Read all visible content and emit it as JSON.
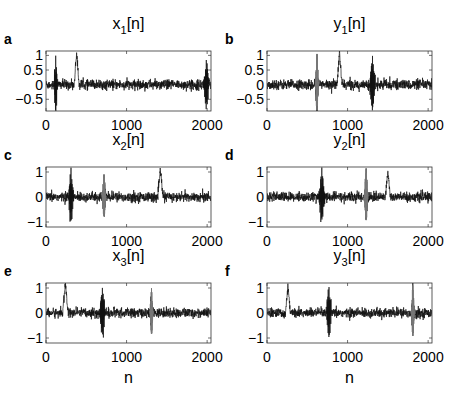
{
  "figure": {
    "width": 460,
    "height": 398,
    "trace_color": "#111111",
    "gray_trace_color": "#777777",
    "axes_color": "#333333"
  },
  "chart_data": [
    {
      "type": "line",
      "panel": "a",
      "title": "x1[n]",
      "title_base": "x",
      "title_sub": "1",
      "title_suffix": "[n]",
      "xlabel": "",
      "ylabel": "",
      "xlim": [
        0,
        2048
      ],
      "ylim": [
        -0.9,
        1.15
      ],
      "xticks": [
        0,
        1000,
        2000
      ],
      "xtick_labels": [
        "0",
        "1000",
        "2000"
      ],
      "yticks": [
        -0.5,
        0,
        0.5,
        1
      ],
      "ytick_labels": [
        "−0.5",
        "0",
        "0.5",
        "1"
      ],
      "grid": false,
      "noise_amplitude": 0.15,
      "events": [
        {
          "kind": "burst",
          "n": 120,
          "width": 30,
          "amplitude": 1.0,
          "gray": false
        },
        {
          "kind": "bump",
          "n": 380,
          "width": 30,
          "amplitude": 1.1,
          "gray": false
        },
        {
          "kind": "burst",
          "n": 1990,
          "width": 40,
          "amplitude": 0.9,
          "gray": false
        }
      ]
    },
    {
      "type": "line",
      "panel": "b",
      "title": "y1[n]",
      "title_base": "y",
      "title_sub": "1",
      "title_suffix": "[n]",
      "xlabel": "",
      "ylabel": "",
      "xlim": [
        0,
        2048
      ],
      "ylim": [
        -0.9,
        1.15
      ],
      "xticks": [
        0,
        1000,
        2000
      ],
      "xtick_labels": [
        "0",
        "1000",
        "2000"
      ],
      "yticks": [
        -0.5,
        0,
        0.5,
        1
      ],
      "ytick_labels": [
        "−0.5",
        "0",
        "0.5",
        "1"
      ],
      "grid": false,
      "noise_amplitude": 0.15,
      "events": [
        {
          "kind": "burst",
          "n": 620,
          "width": 22,
          "amplitude": 1.05,
          "gray": true
        },
        {
          "kind": "bump",
          "n": 900,
          "width": 32,
          "amplitude": 1.05,
          "gray": false
        },
        {
          "kind": "burst",
          "n": 1310,
          "width": 45,
          "amplitude": 0.9,
          "gray": false
        }
      ]
    },
    {
      "type": "line",
      "panel": "c",
      "title": "x2[n]",
      "title_base": "x",
      "title_sub": "2",
      "title_suffix": "[n]",
      "xlabel": "",
      "ylabel": "",
      "xlim": [
        0,
        2048
      ],
      "ylim": [
        -1.2,
        1.2
      ],
      "xticks": [
        0,
        1000,
        2000
      ],
      "xtick_labels": [
        "0",
        "1000",
        "2000"
      ],
      "yticks": [
        -1,
        0,
        1
      ],
      "ytick_labels": [
        "−1",
        "0",
        "1"
      ],
      "grid": false,
      "noise_amplitude": 0.17,
      "events": [
        {
          "kind": "burst",
          "n": 310,
          "width": 40,
          "amplitude": 1.1,
          "gray": false
        },
        {
          "kind": "burst",
          "n": 720,
          "width": 25,
          "amplitude": 0.9,
          "gray": true
        },
        {
          "kind": "bump",
          "n": 1420,
          "width": 32,
          "amplitude": 1.1,
          "gray": false
        }
      ]
    },
    {
      "type": "line",
      "panel": "d",
      "title": "y2[n]",
      "title_base": "y",
      "title_sub": "2",
      "title_suffix": "[n]",
      "xlabel": "",
      "ylabel": "",
      "xlim": [
        0,
        2048
      ],
      "ylim": [
        -1.2,
        1.2
      ],
      "xticks": [
        0,
        1000,
        2000
      ],
      "xtick_labels": [
        "0",
        "1000",
        "2000"
      ],
      "yticks": [
        -1,
        0,
        1
      ],
      "ytick_labels": [
        "−1",
        "0",
        "1"
      ],
      "grid": false,
      "noise_amplitude": 0.17,
      "events": [
        {
          "kind": "burst",
          "n": 680,
          "width": 45,
          "amplitude": 1.1,
          "gray": false
        },
        {
          "kind": "burst",
          "n": 1230,
          "width": 25,
          "amplitude": 1.1,
          "gray": true
        },
        {
          "kind": "bump",
          "n": 1500,
          "width": 32,
          "amplitude": 1.0,
          "gray": false
        }
      ]
    },
    {
      "type": "line",
      "panel": "e",
      "title": "x3[n]",
      "title_base": "x",
      "title_sub": "3",
      "title_suffix": "[n]",
      "xlabel": "n",
      "ylabel": "",
      "xlim": [
        0,
        2048
      ],
      "ylim": [
        -1.2,
        1.2
      ],
      "xticks": [
        0,
        1000,
        2000
      ],
      "xtick_labels": [
        "0",
        "1000",
        "2000"
      ],
      "yticks": [
        -1,
        0,
        1
      ],
      "ytick_labels": [
        "−1",
        "0",
        "1"
      ],
      "grid": false,
      "noise_amplitude": 0.17,
      "events": [
        {
          "kind": "bump",
          "n": 240,
          "width": 34,
          "amplitude": 1.2,
          "gray": false
        },
        {
          "kind": "burst",
          "n": 700,
          "width": 45,
          "amplitude": 1.05,
          "gray": false
        },
        {
          "kind": "burst",
          "n": 1310,
          "width": 22,
          "amplitude": 1.0,
          "gray": true
        }
      ]
    },
    {
      "type": "line",
      "panel": "f",
      "title": "y3[n]",
      "title_base": "y",
      "title_sub": "3",
      "title_suffix": "[n]",
      "xlabel": "n",
      "ylabel": "",
      "xlim": [
        0,
        2048
      ],
      "ylim": [
        -1.2,
        1.2
      ],
      "xticks": [
        0,
        1000,
        2000
      ],
      "xtick_labels": [
        "0",
        "1000",
        "2000"
      ],
      "yticks": [
        -1,
        0,
        1
      ],
      "ytick_labels": [
        "−1",
        "0",
        "1"
      ],
      "grid": false,
      "noise_amplitude": 0.17,
      "events": [
        {
          "kind": "bump",
          "n": 260,
          "width": 34,
          "amplitude": 1.05,
          "gray": false
        },
        {
          "kind": "burst",
          "n": 770,
          "width": 45,
          "amplitude": 1.05,
          "gray": false
        },
        {
          "kind": "burst",
          "n": 1810,
          "width": 22,
          "amplitude": 1.1,
          "gray": true
        }
      ]
    }
  ],
  "layout": {
    "axes": [
      {
        "left": 46,
        "top": 51,
        "width": 165,
        "height": 60
      },
      {
        "left": 267,
        "top": 51,
        "width": 165,
        "height": 60
      },
      {
        "left": 46,
        "top": 167,
        "width": 165,
        "height": 60
      },
      {
        "left": 267,
        "top": 167,
        "width": 165,
        "height": 60
      },
      {
        "left": 46,
        "top": 283,
        "width": 165,
        "height": 60
      },
      {
        "left": 267,
        "top": 283,
        "width": 165,
        "height": 60
      }
    ]
  }
}
